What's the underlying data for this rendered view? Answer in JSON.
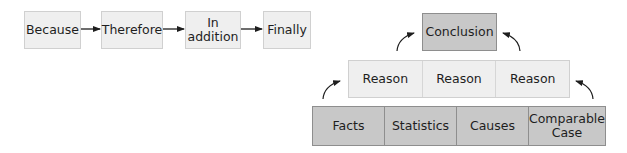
{
  "sequence_flow": {
    "steps": [
      {
        "label": "Because"
      },
      {
        "label": "Therefore"
      },
      {
        "label": "In\naddition"
      },
      {
        "label": "Finally"
      }
    ]
  },
  "argument_pyramid": {
    "conclusion": {
      "label": "Conclusion"
    },
    "reasons": [
      {
        "label": "Reason"
      },
      {
        "label": "Reason"
      },
      {
        "label": "Reason"
      }
    ],
    "evidence": [
      {
        "label": "Facts"
      },
      {
        "label": "Statistics"
      },
      {
        "label": "Causes"
      },
      {
        "label": "Comparable\nCase"
      }
    ]
  },
  "colors": {
    "light_box": "#efefef",
    "dark_box": "#c8c8c8",
    "arrow": "#1e1e1e"
  }
}
